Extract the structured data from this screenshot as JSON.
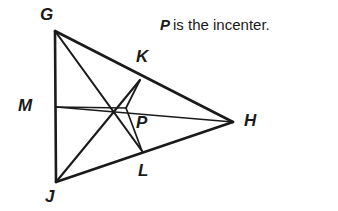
{
  "figure": {
    "type": "geometry-diagram",
    "title_text": "P is the incenter.",
    "caption": {
      "variable": "P",
      "rest": "is the incenter."
    },
    "background_color": "#ffffff",
    "stroke_color": "#1a1a1a",
    "label_color": "#1a1a1a"
  },
  "points": {
    "G": {
      "label": "G",
      "x": 55,
      "y": 31,
      "label_x": 40,
      "label_y": 6,
      "role": "triangle-vertex"
    },
    "J": {
      "label": "J",
      "x": 56,
      "y": 182,
      "label_x": 45,
      "label_y": 188,
      "role": "triangle-vertex"
    },
    "H": {
      "label": "H",
      "x": 233,
      "y": 122,
      "label_x": 244,
      "label_y": 112,
      "role": "triangle-vertex"
    },
    "P": {
      "label": "P",
      "x": 126,
      "y": 108,
      "label_x": 136,
      "label_y": 114,
      "role": "incenter"
    },
    "K": {
      "label": "K",
      "x": 140,
      "y": 80,
      "label_x": 136,
      "label_y": 48,
      "role": "foot-on-GH"
    },
    "L": {
      "label": "L",
      "x": 142,
      "y": 151,
      "label_x": 138,
      "label_y": 162,
      "role": "foot-on-JH"
    },
    "M": {
      "label": "M",
      "x": 56,
      "y": 107,
      "label_x": 18,
      "label_y": 97,
      "role": "foot-on-GJ"
    }
  },
  "segments": [
    {
      "name": "side-GJ",
      "from": "G",
      "to": "J"
    },
    {
      "name": "side-GH",
      "from": "G",
      "to": "H"
    },
    {
      "name": "side-JH",
      "from": "J",
      "to": "H"
    },
    {
      "name": "bisector-G-to-L",
      "from": "G",
      "to": "L"
    },
    {
      "name": "bisector-J-to-K",
      "from": "J",
      "to": "K"
    },
    {
      "name": "bisector-H-to-M",
      "from": "H",
      "to": "M"
    },
    {
      "name": "inradius-P-to-K",
      "from": "P",
      "to": "K"
    },
    {
      "name": "inradius-P-to-L",
      "from": "P",
      "to": "L"
    },
    {
      "name": "inradius-P-to-M",
      "from": "P",
      "to": "M"
    }
  ]
}
